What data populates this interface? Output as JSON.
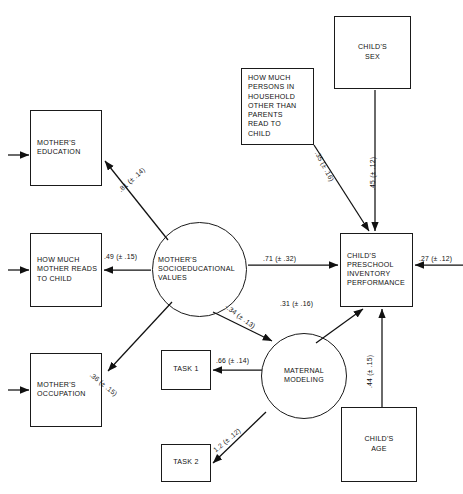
{
  "diagram": {
    "type": "path-diagram",
    "title": "",
    "nodes": [
      {
        "id": "mothers_education",
        "shape": "box",
        "label": "MOTHER'S\nEDUCATION",
        "x": 30,
        "y": 110,
        "w": 72,
        "h": 76,
        "align": "left"
      },
      {
        "id": "how_much_mother_reads",
        "shape": "box",
        "label": "HOW MUCH\nMOTHER READS\nTO CHILD",
        "x": 30,
        "y": 233,
        "w": 72,
        "h": 74,
        "align": "left"
      },
      {
        "id": "mothers_occupation",
        "shape": "box",
        "label": "MOTHER'S\nOCCUPATION",
        "x": 30,
        "y": 353,
        "w": 72,
        "h": 74,
        "align": "left"
      },
      {
        "id": "mothers_socioeducational_values",
        "shape": "circle",
        "label": "MOTHER'S\nSOCIOEDUCATIONAL\nVALUES",
        "x": 152,
        "y": 222,
        "w": 95,
        "h": 95,
        "align": "left"
      },
      {
        "id": "task_1",
        "shape": "box",
        "label": "TASK 1",
        "x": 161,
        "y": 350,
        "w": 50,
        "h": 40,
        "align": "center"
      },
      {
        "id": "task_2",
        "shape": "box",
        "label": "TASK 2",
        "x": 161,
        "y": 444,
        "w": 50,
        "h": 38,
        "align": "center"
      },
      {
        "id": "maternal_modeling",
        "shape": "circle",
        "label": "MATERNAL\nMODELING",
        "x": 261,
        "y": 333,
        "w": 86,
        "h": 86,
        "align": "center"
      },
      {
        "id": "how_much_persons_household",
        "shape": "box",
        "label": "HOW MUCH\nPERSONS IN\nHOUSEHOLD\nOTHER THAN\nPARENTS\nREAD TO\nCHILD",
        "x": 241,
        "y": 68,
        "w": 73,
        "h": 77,
        "align": "left"
      },
      {
        "id": "childs_sex",
        "shape": "box",
        "label": "CHILD'S\nSEX",
        "x": 334,
        "y": 16,
        "w": 77,
        "h": 73,
        "align": "center"
      },
      {
        "id": "childs_preschool_inventory",
        "shape": "box",
        "label": "CHILD'S\nPRESCHOOL\nINVENTORY\nPERFORMANCE",
        "x": 340,
        "y": 233,
        "w": 73,
        "h": 74,
        "align": "left"
      },
      {
        "id": "childs_age",
        "shape": "box",
        "label": "CHILD'S\nAGE",
        "x": 341,
        "y": 407,
        "w": 76,
        "h": 75,
        "align": "center"
      }
    ],
    "paths": [
      {
        "id": "p_values_to_education",
        "from": "mothers_socioeducational_values",
        "to": "mothers_education",
        "coefficient": ".81",
        "se": "(± .14)",
        "label": ".81 (± .14)",
        "x": 117,
        "y": 188,
        "rotate": -42
      },
      {
        "id": "p_values_to_reads",
        "from": "mothers_socioeducational_values",
        "to": "how_much_mother_reads",
        "coefficient": ".49",
        "se": "(± .15)",
        "label": ".49 (± .15)",
        "x": 104,
        "y": 253,
        "rotate": 0
      },
      {
        "id": "p_values_to_occupation",
        "from": "mothers_socioeducational_values",
        "to": "mothers_occupation",
        "coefficient": ".36",
        "se": "(± .15)",
        "label": ".36 (± .15)",
        "x": 93,
        "y": 371,
        "rotate": 39
      },
      {
        "id": "p_values_to_preschool",
        "from": "mothers_socioeducational_values",
        "to": "childs_preschool_inventory",
        "coefficient": ".71",
        "se": "(± .32)",
        "label": ".71 (± .32)",
        "x": 263,
        "y": 255,
        "rotate": 0
      },
      {
        "id": "p_values_to_modeling",
        "from": "mothers_socioeducational_values",
        "to": "maternal_modeling",
        "coefficient": "-.34",
        "se": "(± .13)",
        "label": "-.34 (± .13)",
        "x": 231,
        "y": 303,
        "rotate": 36
      },
      {
        "id": "p_modeling_to_task1",
        "from": "maternal_modeling",
        "to": "task_1",
        "coefficient": ".66",
        "se": "(± .14)",
        "label": ".66 (± .14)",
        "x": 216,
        "y": 357,
        "rotate": 0
      },
      {
        "id": "p_modeling_to_task2",
        "from": "maternal_modeling",
        "to": "task_2",
        "coefficient": "1.2",
        "se": "(± .12)",
        "label": "1.2 (± .12)",
        "x": 212,
        "y": 448,
        "rotate": -40
      },
      {
        "id": "p_modeling_to_preschool",
        "from": "maternal_modeling",
        "to": "childs_preschool_inventory",
        "coefficient": ".31",
        "se": "(± .16)",
        "label": ".31 (± .16)",
        "x": 280,
        "y": 300,
        "rotate": 0
      },
      {
        "id": "p_persons_to_preschool",
        "from": "how_much_persons_household",
        "to": "childs_preschool_inventory",
        "coefficient": ".35",
        "se": "(± .16)",
        "label": ".35 (± .16)",
        "x": 320,
        "y": 150,
        "rotate": 62
      },
      {
        "id": "p_sex_to_preschool",
        "from": "childs_sex",
        "to": "childs_preschool_inventory",
        "coefficient": ".45",
        "se": "(± .12)",
        "label": ".45 (± .12)",
        "x": 369,
        "y": 190,
        "rotate": -90
      },
      {
        "id": "p_age_to_preschool",
        "from": "childs_age",
        "to": "childs_preschool_inventory",
        "coefficient": ".44",
        "se": "(± .15)",
        "label": ".44 (± .15)",
        "x": 366,
        "y": 388,
        "rotate": -90
      },
      {
        "id": "p_residual_preschool",
        "from": "residual",
        "to": "childs_preschool_inventory",
        "coefficient": ".27",
        "se": "(± .12)",
        "label": ".27 (± .12)",
        "x": 422,
        "y": 255,
        "rotate": 0
      }
    ]
  }
}
